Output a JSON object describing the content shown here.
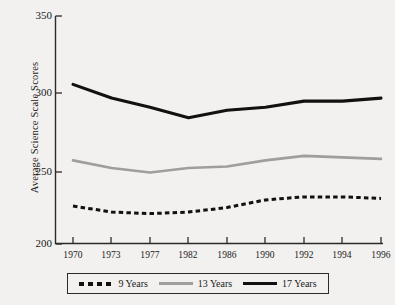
{
  "chart_data": {
    "type": "line",
    "title": "",
    "xlabel": "",
    "ylabel": "Average Science Scale Scores",
    "categories": [
      "1970",
      "1973",
      "1977",
      "1982",
      "1986",
      "1990",
      "1992",
      "1994",
      "1996"
    ],
    "ylim": [
      200,
      350
    ],
    "yticks": [
      200,
      250,
      300,
      350
    ],
    "grid": false,
    "legend_position": "below-plot",
    "series": [
      {
        "name": "9 Years",
        "style": "dashed",
        "color": "#111111",
        "values": [
          225,
          221,
          220,
          221,
          224,
          229,
          231,
          231,
          230
        ]
      },
      {
        "name": "13 Years",
        "style": "solid",
        "color": "#9e9e9e",
        "values": [
          255,
          250,
          247,
          250,
          251,
          255,
          258,
          257,
          256
        ]
      },
      {
        "name": "17 Years",
        "style": "solid",
        "color": "#111111",
        "values": [
          305,
          296,
          290,
          283,
          288,
          290,
          294,
          294,
          296
        ]
      }
    ]
  },
  "axes": {
    "ytick_labels": [
      "350",
      "300",
      "250",
      "200"
    ],
    "xtick_labels": [
      "1970",
      "1973",
      "1977",
      "1982",
      "1986",
      "1990",
      "1992",
      "1994",
      "1996"
    ],
    "ylabel": "Average Science Scale Scores"
  },
  "legend": {
    "entries": [
      {
        "label": "9 Years",
        "swatch": "dashed-black"
      },
      {
        "label": "13 Years",
        "swatch": "solid-gray"
      },
      {
        "label": "17 Years",
        "swatch": "solid-black"
      }
    ]
  }
}
